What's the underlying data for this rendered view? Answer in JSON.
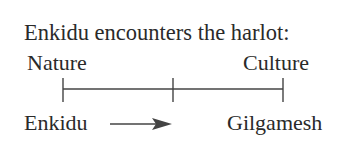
{
  "title": "Enkidu encounters the harlot:",
  "scale": {
    "left_label": "Nature",
    "right_label": "Culture"
  },
  "below": {
    "left_label": "Enkidu",
    "right_label": "Gilgamesh",
    "arrow": "right-arrow"
  },
  "colors": {
    "text": "#2a2a2a",
    "line": "#444444"
  }
}
